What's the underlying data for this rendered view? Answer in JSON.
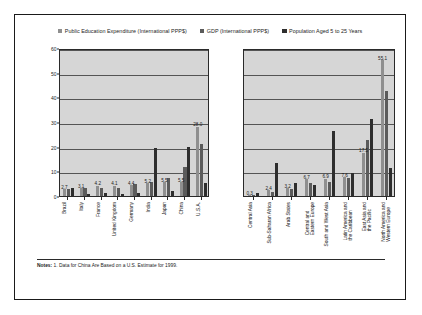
{
  "legend": {
    "items": [
      {
        "label": "Public Education Expenditure (International PPP$)",
        "color": "#8f8f8f"
      },
      {
        "label": "GDP (International PPP$)",
        "color": "#5b5b5b"
      },
      {
        "label": "Population Aged 5 to 25 Years",
        "color": "#2e2e2e"
      }
    ]
  },
  "axis": {
    "ylabel": "Percentage of World Total",
    "yticks": [
      "0",
      "10",
      "20",
      "30",
      "40",
      "50",
      "60"
    ]
  },
  "notes": {
    "prefix": "Notes:",
    "text": " 1. Data for China Are Based on a U.S. Estimate for 1999."
  },
  "chart_data": [
    {
      "type": "bar",
      "panel": "left",
      "title": "",
      "xlabel": "",
      "ylabel": "Percentage of World Total",
      "ylim": [
        0,
        60
      ],
      "yticks": [
        0,
        10,
        20,
        30,
        40,
        50,
        60
      ],
      "grid": true,
      "legend_position": "top-center",
      "categories": [
        "Brazil",
        "Italy",
        "France",
        "United Kingdom",
        "Germany",
        "India",
        "Japan",
        "China",
        "U.S.A."
      ],
      "series": [
        {
          "name": "Public Education Expenditure (International PPP$)",
          "color": "#8f8f8f",
          "values": [
            2.7,
            3.1,
            4.2,
            4.1,
            4.4,
            5.2,
            5.5,
            5.5,
            28.0
          ]
        },
        {
          "name": "GDP (International PPP$)",
          "color": "#5b5b5b",
          "values": [
            2.7,
            3.1,
            3.4,
            3.3,
            4.7,
            5.6,
            7.4,
            11.9,
            21.0
          ]
        },
        {
          "name": "Population Aged 5 to 25 Years",
          "color": "#2e2e2e",
          "values": [
            3.4,
            1.0,
            1.1,
            1.0,
            1.3,
            19.6,
            2.1,
            19.8,
            5.3
          ]
        }
      ],
      "data_labels": [
        "2.7",
        "3.1",
        "4.2",
        "4.1",
        "4.4",
        "5.2",
        "5.5",
        "5.5",
        "28.0"
      ]
    },
    {
      "type": "bar",
      "panel": "right",
      "title": "",
      "xlabel": "",
      "ylabel": "Percentage of World Total",
      "ylim": [
        0,
        60
      ],
      "yticks": [
        0,
        10,
        20,
        30,
        40,
        50,
        60
      ],
      "grid": true,
      "legend_position": "top-center",
      "categories": [
        "Central Asia",
        "Sub-Saharan Africa",
        "Arab States",
        "Central and\nEastern Europe",
        "South and West Asia",
        "Latin America and\nthe Caribbean",
        "East Asia and\nthe Pacific",
        "North America and\nWestern Europe"
      ],
      "series": [
        {
          "name": "Public Education Expenditure (International PPP$)",
          "color": "#8f8f8f",
          "values": [
            0.3,
            2.4,
            3.2,
            6.7,
            6.9,
            7.6,
            17.5,
            55.1
          ]
        },
        {
          "name": "GDP (International PPP$)",
          "color": "#5b5b5b",
          "values": [
            0.3,
            1.8,
            2.7,
            5.2,
            5.7,
            7.2,
            22.6,
            42.6
          ]
        },
        {
          "name": "Population Aged 5 to 25 Years",
          "color": "#2e2e2e",
          "values": [
            1.2,
            13.2,
            5.2,
            4.6,
            26.4,
            9.5,
            31.1,
            11.2
          ]
        }
      ],
      "data_labels": [
        "0.3",
        "2.4",
        "3.2",
        "6.7",
        "6.9",
        "7.6",
        "17.5",
        "55.1"
      ]
    }
  ]
}
